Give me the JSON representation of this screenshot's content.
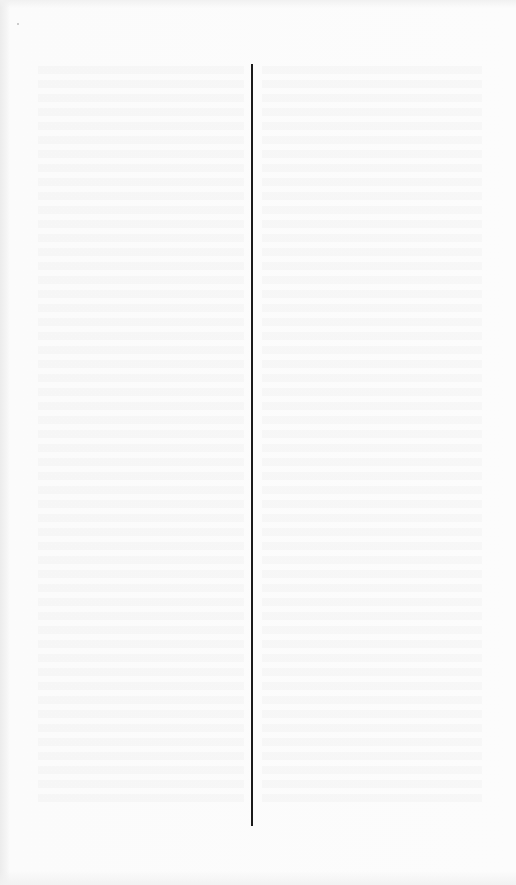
{
  "document": {
    "type": "scanned-page",
    "content": "blank page with faint bleed-through text (illegible)",
    "layout": "two-column with vertical column rule",
    "colors": {
      "paper": "#fbfbfb",
      "rule": "#1a1a1a",
      "margin_edge": "#ececec"
    }
  }
}
